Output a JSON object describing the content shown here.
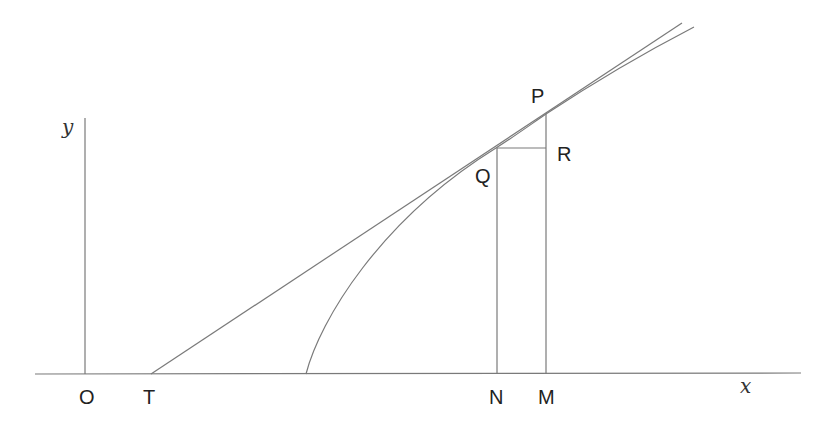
{
  "diagram": {
    "title": "",
    "axes": {
      "x_label": "x",
      "y_label": "y",
      "origin_label": "O"
    },
    "points": {
      "T": "T",
      "N": "N",
      "M": "M",
      "P": "P",
      "Q": "Q",
      "R": "R"
    },
    "colors": {
      "line": "#7a7a7a",
      "text": "#222222",
      "background": "#ffffff"
    }
  }
}
